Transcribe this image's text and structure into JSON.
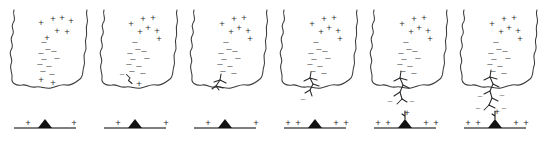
{
  "figure": {
    "panel_count": 6,
    "background_color": "#ffffff",
    "symbols": {
      "positive": "+",
      "negative": "–"
    },
    "colors": {
      "cloud_outline": "#3a3a3a",
      "leader": "#2a2a2a",
      "ground_line": "#555555",
      "mountain": "#111111",
      "positive_charge": "#2e2e2e",
      "negative_charge": "#5a5a5a"
    }
  },
  "panels": [
    {
      "id": "panel-1",
      "name": "charge-separation",
      "cloud_positive_charges": [
        {
          "x": 41,
          "y": 23
        },
        {
          "x": 53,
          "y": 19
        },
        {
          "x": 62,
          "y": 18
        },
        {
          "x": 71,
          "y": 21
        },
        {
          "x": 57,
          "y": 31
        },
        {
          "x": 67,
          "y": 32
        },
        {
          "x": 47,
          "y": 38
        }
      ],
      "cloud_negative_charges": [
        {
          "x": 44,
          "y": 42
        },
        {
          "x": 48,
          "y": 49
        },
        {
          "x": 41,
          "y": 53
        },
        {
          "x": 54,
          "y": 51
        },
        {
          "x": 44,
          "y": 59
        },
        {
          "x": 57,
          "y": 58
        },
        {
          "x": 40,
          "y": 64
        },
        {
          "x": 49,
          "y": 66
        },
        {
          "x": 43,
          "y": 71
        },
        {
          "x": 52,
          "y": 74
        }
      ],
      "cloud_base_positive_charges": [
        {
          "x": 41,
          "y": 80
        },
        {
          "x": 53,
          "y": 83
        }
      ],
      "leader_segments": [],
      "leader_negative_charges": [],
      "ground_positive_charges": [
        {
          "x": 28,
          "y": 123
        },
        {
          "x": 74,
          "y": 123
        }
      ],
      "ground_streamer": false
    },
    {
      "id": "panel-2",
      "name": "leader-initiation",
      "cloud_positive_charges": [
        {
          "x": 131,
          "y": 24
        },
        {
          "x": 143,
          "y": 19
        },
        {
          "x": 153,
          "y": 18
        },
        {
          "x": 148,
          "y": 28
        },
        {
          "x": 157,
          "y": 31
        },
        {
          "x": 140,
          "y": 32
        },
        {
          "x": 159,
          "y": 39
        }
      ],
      "cloud_negative_charges": [
        {
          "x": 135,
          "y": 42
        },
        {
          "x": 138,
          "y": 49
        },
        {
          "x": 130,
          "y": 53
        },
        {
          "x": 144,
          "y": 51
        },
        {
          "x": 133,
          "y": 59
        },
        {
          "x": 147,
          "y": 58
        },
        {
          "x": 129,
          "y": 64
        },
        {
          "x": 139,
          "y": 66
        },
        {
          "x": 132,
          "y": 71
        },
        {
          "x": 143,
          "y": 73
        }
      ],
      "cloud_base_positive_charges": [
        {
          "x": 139,
          "y": 84
        }
      ],
      "leader_segments": [
        "M126.5,74.5 L130,78 L128.5,80.5 L132,83.5"
      ],
      "leader_negative_charges": [
        {
          "x": 122,
          "y": 74
        }
      ],
      "ground_positive_charges": [
        {
          "x": 118,
          "y": 123
        },
        {
          "x": 166,
          "y": 123
        }
      ],
      "ground_streamer": false
    },
    {
      "id": "panel-3",
      "name": "leader-branching-at-base",
      "cloud_positive_charges": [
        {
          "x": 222,
          "y": 24
        },
        {
          "x": 234,
          "y": 19
        },
        {
          "x": 244,
          "y": 18
        },
        {
          "x": 239,
          "y": 28
        },
        {
          "x": 248,
          "y": 31
        },
        {
          "x": 231,
          "y": 32
        },
        {
          "x": 250,
          "y": 39
        }
      ],
      "cloud_negative_charges": [
        {
          "x": 226,
          "y": 42
        },
        {
          "x": 229,
          "y": 49
        },
        {
          "x": 221,
          "y": 53
        },
        {
          "x": 235,
          "y": 51
        },
        {
          "x": 224,
          "y": 59
        },
        {
          "x": 238,
          "y": 58
        },
        {
          "x": 220,
          "y": 64
        },
        {
          "x": 230,
          "y": 66
        },
        {
          "x": 223,
          "y": 71
        },
        {
          "x": 234,
          "y": 73
        }
      ],
      "cloud_base_positive_charges": [],
      "leader_segments": [
        "M221,74 L220,80 L216,86 L219,90",
        "M220,80 L214,82",
        "M220,80 L226,83",
        "M216,86 L212,89",
        "M216,86 L223,88"
      ],
      "leader_negative_charges": [],
      "ground_positive_charges": [
        {
          "x": 208,
          "y": 123
        },
        {
          "x": 256,
          "y": 123
        }
      ],
      "ground_streamer": false
    },
    {
      "id": "panel-4",
      "name": "leader-descending",
      "cloud_positive_charges": [
        {
          "x": 312,
          "y": 24
        },
        {
          "x": 324,
          "y": 19
        },
        {
          "x": 334,
          "y": 18
        },
        {
          "x": 329,
          "y": 28
        },
        {
          "x": 338,
          "y": 31
        },
        {
          "x": 321,
          "y": 32
        },
        {
          "x": 340,
          "y": 39
        }
      ],
      "cloud_negative_charges": [
        {
          "x": 316,
          "y": 42
        },
        {
          "x": 319,
          "y": 49
        },
        {
          "x": 311,
          "y": 53
        },
        {
          "x": 325,
          "y": 51
        },
        {
          "x": 314,
          "y": 59
        },
        {
          "x": 328,
          "y": 58
        },
        {
          "x": 310,
          "y": 64
        },
        {
          "x": 320,
          "y": 66
        },
        {
          "x": 313,
          "y": 71
        },
        {
          "x": 324,
          "y": 73
        }
      ],
      "cloud_base_positive_charges": [],
      "leader_segments": [
        "M311,72 L310,78 L313,84 L310,90 L312,96",
        "M310,78 L304,81",
        "M310,78 L317,80",
        "M313,84 L319,86",
        "M310,90 L305,93"
      ],
      "leader_negative_charges": [
        {
          "x": 303,
          "y": 99
        }
      ],
      "ground_positive_charges": [
        {
          "x": 288,
          "y": 123
        },
        {
          "x": 298,
          "y": 123
        },
        {
          "x": 336,
          "y": 123
        },
        {
          "x": 346,
          "y": 123
        }
      ],
      "ground_streamer": false
    },
    {
      "id": "panel-5",
      "name": "upward-streamer-initiated",
      "cloud_positive_charges": [
        {
          "x": 402,
          "y": 24
        },
        {
          "x": 414,
          "y": 19
        },
        {
          "x": 424,
          "y": 18
        },
        {
          "x": 419,
          "y": 28
        },
        {
          "x": 428,
          "y": 31
        },
        {
          "x": 411,
          "y": 32
        },
        {
          "x": 430,
          "y": 39
        }
      ],
      "cloud_negative_charges": [
        {
          "x": 406,
          "y": 42
        },
        {
          "x": 409,
          "y": 49
        },
        {
          "x": 401,
          "y": 53
        },
        {
          "x": 415,
          "y": 51
        },
        {
          "x": 404,
          "y": 59
        },
        {
          "x": 418,
          "y": 58
        },
        {
          "x": 400,
          "y": 64
        },
        {
          "x": 410,
          "y": 66
        },
        {
          "x": 403,
          "y": 71
        },
        {
          "x": 414,
          "y": 73
        }
      ],
      "cloud_base_positive_charges": [],
      "leader_segments": [
        "M401,71 L400,78 L403,85 L400,92 L402,99",
        "M400,78 L394,81",
        "M400,78 L407,80",
        "M403,85 L409,88",
        "M400,92 L394,96",
        "M402,99 L407,102",
        "M402,99 L397,104"
      ],
      "leader_negative_charges": [
        {
          "x": 390,
          "y": 101
        },
        {
          "x": 412,
          "y": 101
        }
      ],
      "ground_positive_charges": [
        {
          "x": 378,
          "y": 123
        },
        {
          "x": 388,
          "y": 123
        },
        {
          "x": 426,
          "y": 123
        },
        {
          "x": 436,
          "y": 123
        }
      ],
      "ground_streamer": true,
      "ground_streamer_positive": {
        "x": 407,
        "y": 113
      }
    },
    {
      "id": "panel-6",
      "name": "attachment-imminent",
      "cloud_positive_charges": [
        {
          "x": 492,
          "y": 24
        },
        {
          "x": 504,
          "y": 19
        },
        {
          "x": 514,
          "y": 18
        },
        {
          "x": 509,
          "y": 28
        },
        {
          "x": 518,
          "y": 31
        },
        {
          "x": 501,
          "y": 32
        },
        {
          "x": 520,
          "y": 39
        }
      ],
      "cloud_negative_charges": [
        {
          "x": 496,
          "y": 42
        },
        {
          "x": 499,
          "y": 49
        },
        {
          "x": 491,
          "y": 53
        },
        {
          "x": 505,
          "y": 51
        },
        {
          "x": 494,
          "y": 59
        },
        {
          "x": 508,
          "y": 58
        },
        {
          "x": 490,
          "y": 64
        },
        {
          "x": 500,
          "y": 66
        },
        {
          "x": 493,
          "y": 71
        },
        {
          "x": 504,
          "y": 73
        }
      ],
      "cloud_base_positive_charges": [],
      "leader_segments": [
        "M491,70 L490,77 L493,84 L490,91 L492,98 L489,105",
        "M490,77 L484,80",
        "M490,77 L497,79",
        "M493,84 L499,87",
        "M490,91 L484,94",
        "M492,98 L498,101",
        "M489,105 L495,108",
        "M489,105 L484,110"
      ],
      "leader_negative_charges": [
        {
          "x": 480,
          "y": 96
        },
        {
          "x": 502,
          "y": 95
        },
        {
          "x": 478,
          "y": 108
        },
        {
          "x": 504,
          "y": 108
        }
      ],
      "ground_positive_charges": [
        {
          "x": 468,
          "y": 123
        },
        {
          "x": 478,
          "y": 123
        },
        {
          "x": 516,
          "y": 123
        },
        {
          "x": 526,
          "y": 123
        }
      ],
      "ground_streamer": true,
      "ground_streamer_positive": {
        "x": 497,
        "y": 112
      }
    }
  ],
  "cloud_outline_path": "M14,10 C12,15 17,18 13,23 C10,28 16,31 12,36 C9,41 15,45 11,50 C8,55 14,59 11,64 C9,69 13,73 12,78 C11,83 16,86 22,85 C27,84 30,88 36,87 C41,86 45,89 51,88 C57,87 60,84 66,85 C72,86 76,82 80,79 C84,76 82,71 84,66 C86,61 82,57 85,52 C88,47 84,43 86,38 C88,33 85,29 87,24 C89,19 85,15 87,10",
  "ground": {
    "line_y": 128,
    "panel_line_width": 62,
    "mountain_width": 14,
    "mountain_height": 9
  },
  "panel_origins_x": [
    14,
    104,
    194,
    284,
    374,
    464
  ]
}
